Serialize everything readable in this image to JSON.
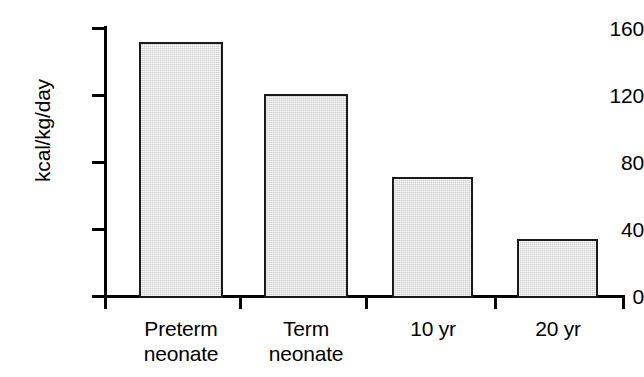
{
  "chart_data": {
    "type": "bar",
    "title": "",
    "subtitle": "",
    "xlabel": "",
    "ylabel": "kcal/kg/day",
    "categories": [
      "Preterm neonate",
      "Term neonate",
      "10 yr",
      "20 yr"
    ],
    "category_lines": [
      [
        "Preterm",
        "neonate"
      ],
      [
        "Term",
        "neonate"
      ],
      [
        "10 yr"
      ],
      [
        "20 yr"
      ]
    ],
    "values": [
      152,
      121,
      72,
      35
    ],
    "ylim": [
      0,
      160
    ],
    "yticks": [
      0,
      40,
      80,
      120,
      160
    ],
    "ytick_labels": [
      "0",
      "40",
      "80",
      "120",
      "160"
    ],
    "xticks_between_bars": true,
    "grid": false,
    "legend": null,
    "annotations": [],
    "colors": {
      "bar_fill": "#dcdcdc",
      "bar_stroke": "#1a1a1a",
      "axis": "#000000",
      "text": "#000000",
      "background": "#ffffff"
    }
  }
}
